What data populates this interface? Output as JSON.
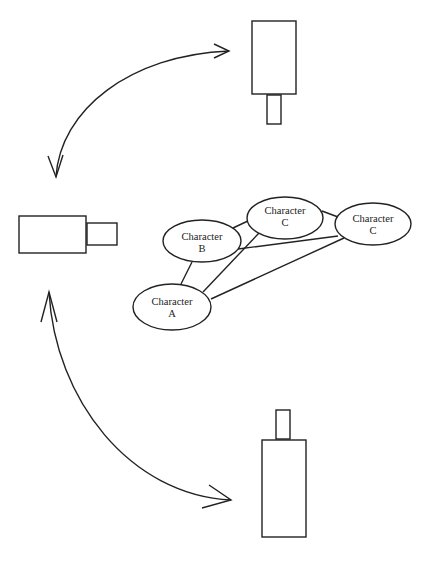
{
  "diagram": {
    "type": "camera-position-diagram",
    "cameras": [
      {
        "id": "camera-top",
        "orientation": "pointing-down",
        "body": {
          "x": 252,
          "y": 21,
          "w": 44,
          "h": 73
        },
        "lens": {
          "x": 267,
          "y": 95,
          "w": 14,
          "h": 29
        }
      },
      {
        "id": "camera-left",
        "orientation": "pointing-right",
        "body": {
          "x": 19,
          "y": 216,
          "w": 67,
          "h": 37
        },
        "lens": {
          "x": 87,
          "y": 223,
          "w": 30,
          "h": 22
        }
      },
      {
        "id": "camera-bottom",
        "orientation": "pointing-up",
        "body": {
          "x": 262,
          "y": 440,
          "w": 44,
          "h": 97
        },
        "lens": {
          "x": 276,
          "y": 410,
          "w": 14,
          "h": 29
        }
      }
    ],
    "arrows": [
      {
        "id": "arrow-top-arc",
        "from": "camera-left",
        "to": "camera-top",
        "bidirectional": true
      },
      {
        "id": "arrow-bottom-arc",
        "from": "camera-left",
        "to": "camera-bottom",
        "bidirectional": true
      }
    ],
    "characters": [
      {
        "id": "character-b",
        "line1": "Character",
        "line2": "B",
        "cx": 202,
        "cy": 241,
        "rx": 39,
        "ry": 21
      },
      {
        "id": "character-c-middle",
        "line1": "Character",
        "line2": "C",
        "cx": 285,
        "cy": 218,
        "rx": 38,
        "ry": 21
      },
      {
        "id": "character-c-right",
        "line1": "Character",
        "line2": "C",
        "cx": 373,
        "cy": 224,
        "rx": 38,
        "ry": 21
      },
      {
        "id": "character-a",
        "line1": "Character",
        "line2": "A",
        "cx": 172,
        "cy": 307,
        "rx": 39,
        "ry": 23
      }
    ],
    "connections": [
      {
        "from": "character-b",
        "to": "character-c-middle"
      },
      {
        "from": "character-b",
        "to": "character-c-right"
      },
      {
        "from": "character-b",
        "to": "character-a"
      },
      {
        "from": "character-c-middle",
        "to": "character-c-right"
      },
      {
        "from": "character-c-middle",
        "to": "character-a"
      },
      {
        "from": "character-c-right",
        "to": "character-a"
      }
    ]
  }
}
